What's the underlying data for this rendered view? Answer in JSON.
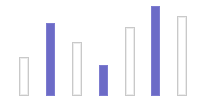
{
  "chart_data": {
    "type": "bar",
    "title": "",
    "xlabel": "",
    "ylabel": "",
    "grid": false,
    "legend": null,
    "categories": [
      "1",
      "2",
      "3",
      "4",
      "5",
      "6",
      "7"
    ],
    "values": [
      39,
      73,
      54,
      31,
      69,
      90,
      80
    ],
    "styles": [
      "outline",
      "filled",
      "outline",
      "filled",
      "outline",
      "filled",
      "outline"
    ],
    "colors": {
      "filled": "#6c6bc7",
      "outline": "#c9c9c9"
    },
    "ylim": [
      0,
      100
    ]
  },
  "layout": {
    "baseline_y": 96,
    "px_per_unit": 1,
    "bars": [
      {
        "x": 19,
        "width": 10
      },
      {
        "x": 46,
        "width": 9
      },
      {
        "x": 72,
        "width": 10
      },
      {
        "x": 99,
        "width": 9
      },
      {
        "x": 125,
        "width": 10
      },
      {
        "x": 151,
        "width": 9
      },
      {
        "x": 177,
        "width": 10
      }
    ]
  }
}
